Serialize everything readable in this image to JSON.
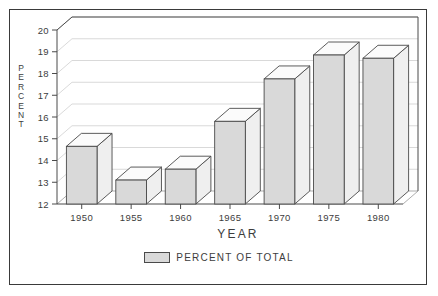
{
  "chart_data": {
    "type": "bar",
    "title": "",
    "subtitle": "",
    "xlabel": "YEAR",
    "ylabel": "PERCENT",
    "categories": [
      "1950",
      "1955",
      "1960",
      "1965",
      "1970",
      "1975",
      "1980"
    ],
    "values": [
      14.65,
      13.1,
      13.6,
      15.8,
      17.75,
      18.85,
      18.7
    ],
    "series": [
      {
        "name": "PERCENT OF TOTAL",
        "values": [
          14.65,
          13.1,
          13.6,
          15.8,
          17.75,
          18.85,
          18.7
        ]
      }
    ],
    "ylim": [
      12,
      20
    ],
    "ytick_labels": [
      "12",
      "13",
      "14",
      "15",
      "16",
      "17",
      "18",
      "19",
      "20"
    ],
    "ytick_values": [
      12,
      13,
      14,
      15,
      16,
      17,
      18,
      19,
      20
    ],
    "xtick_labels": [
      "1950",
      "1955",
      "1960",
      "1965",
      "1970",
      "1975",
      "1980"
    ],
    "grid": true,
    "grid_axis": "y",
    "legend": {
      "position": "bottom-center",
      "entries": [
        {
          "label": "PERCENT OF TOTAL",
          "color": "#d9d9d9"
        }
      ]
    },
    "style": {
      "three_d": true,
      "bar_face_color": "#d9d9d9",
      "bar_top_color": "#fbfbfb",
      "bar_side_color": "#efefef",
      "bar_edge_color": "#4a4a4a",
      "grid_color": "#c8c8c8",
      "axis_color": "#4a4a4a",
      "text_color": "#3d3d3d",
      "background_color": "#ffffff",
      "frame_color": "#3a3a3a"
    }
  },
  "axis": {
    "y_title_letters": [
      "P",
      "E",
      "R",
      "C",
      "E",
      "N",
      "T"
    ],
    "x_title": "YEAR"
  },
  "legend": {
    "label": "PERCENT OF TOTAL"
  }
}
